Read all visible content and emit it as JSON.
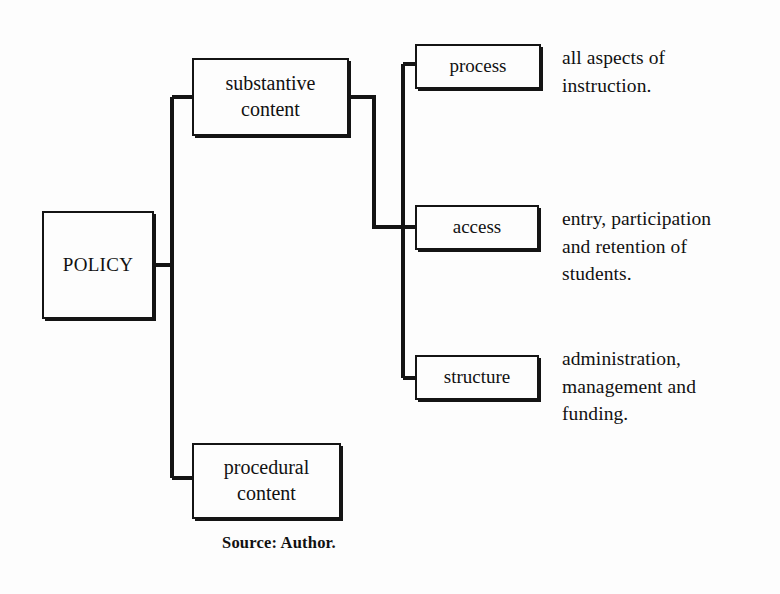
{
  "diagram": {
    "line_color": "#141414",
    "background_color": "#fdfdfd",
    "nodes": {
      "root": {
        "label": "POLICY"
      },
      "substantive": {
        "label": "substantive\ncontent"
      },
      "procedural": {
        "label": "procedural\ncontent"
      },
      "process": {
        "label": "process"
      },
      "access": {
        "label": "access"
      },
      "structure": {
        "label": "structure"
      }
    },
    "descriptions": {
      "process": "all aspects of\ninstruction.",
      "access": "entry, participation\nand retention of\nstudents.",
      "structure": "administration,\nmanagement and\nfunding."
    },
    "caption": {
      "label": "Source:",
      "value": "Author."
    }
  }
}
